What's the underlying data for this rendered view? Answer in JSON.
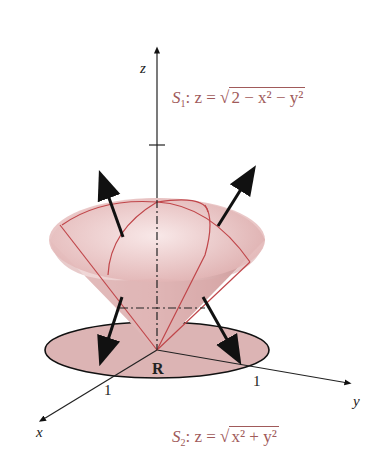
{
  "figure": {
    "axes": {
      "x_label": "x",
      "y_label": "y",
      "z_label": "z"
    },
    "tick_labels": {
      "x_tick": "1",
      "y_tick": "1"
    },
    "region_label": "R",
    "surface_1": {
      "name": "S",
      "sub": "1",
      "prefix": ": z = ",
      "radicand": "2 − x² − y²"
    },
    "surface_2": {
      "name": "S",
      "sub": "2",
      "prefix": ": z = ",
      "radicand": "x² + y²"
    },
    "colors": {
      "surface_fill": "#e8c4c4",
      "edge": "#c0464a",
      "disk_fill": "#dcb4b4",
      "label": "#a05a5a",
      "axis": "#222222"
    }
  }
}
